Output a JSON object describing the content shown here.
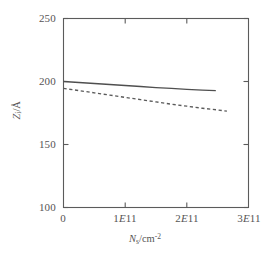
{
  "chart_data": {
    "type": "line",
    "title": "",
    "subtitle": "",
    "xlabel_plain": "Ns/cm^-2",
    "ylabel_plain": "Z/A",
    "xlabel_symbol": "N",
    "xlabel_sub": "s",
    "xlabel_unit": "/cm",
    "xlabel_exp": "-2",
    "ylabel_symbol": "Z",
    "ylabel_sub": "i",
    "ylabel_unit": "/Å",
    "xlim": [
      0,
      300000000000
    ],
    "ylim": [
      100,
      250
    ],
    "x_ticks": [
      0,
      100000000000,
      200000000000,
      300000000000
    ],
    "x_tick_labels": [
      "0",
      "1E11",
      "2E11",
      "3E11"
    ],
    "y_ticks": [
      100,
      150,
      200,
      250
    ],
    "y_tick_labels": [
      "100",
      "150",
      "200",
      "250"
    ],
    "grid": false,
    "legend": "none",
    "frame": "box",
    "series": [
      {
        "name": "solid-curve",
        "style": "solid",
        "color": "#4f4f4f",
        "x": [
          0,
          25000000000,
          50000000000,
          75000000000,
          100000000000,
          125000000000,
          150000000000,
          175000000000,
          200000000000,
          225000000000,
          247000000000
        ],
        "values": [
          200.0,
          199.2,
          198.4,
          197.6,
          196.8,
          196.0,
          195.2,
          194.5,
          193.8,
          193.2,
          192.7
        ]
      },
      {
        "name": "dashed-curve",
        "style": "dashed",
        "color": "#5a5a5a",
        "x": [
          0,
          25000000000,
          50000000000,
          75000000000,
          100000000000,
          125000000000,
          150000000000,
          175000000000,
          200000000000,
          225000000000,
          250000000000,
          265000000000
        ],
        "values": [
          194.5,
          192.8,
          191.0,
          189.2,
          187.4,
          185.6,
          183.8,
          182.0,
          180.4,
          178.8,
          177.4,
          176.5
        ]
      }
    ]
  },
  "axes": {
    "x_tick_text": [
      "0",
      "1E11",
      "2E11",
      "3E11"
    ],
    "y_tick_text": [
      "250",
      "200",
      "150",
      "100"
    ]
  }
}
